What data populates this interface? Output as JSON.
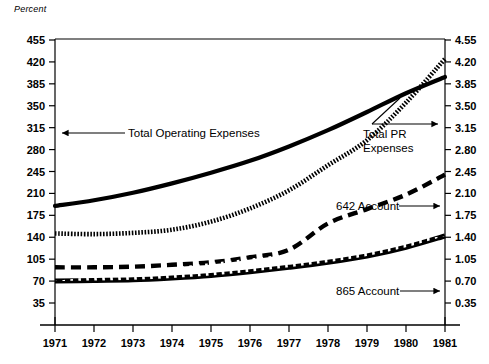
{
  "figure": {
    "unit_label": "Percent"
  },
  "chart_data": {
    "type": "line",
    "title": "",
    "subtitle": "",
    "xlabel": "",
    "ylabel": "Percent",
    "grid": false,
    "legend_position": "inline-annotations",
    "x": [
      1971,
      1972,
      1973,
      1974,
      1975,
      1976,
      1977,
      1978,
      1979,
      1980,
      1981
    ],
    "xtick_labels": [
      "1971",
      "1972",
      "1973",
      "1974",
      "1975",
      "1976",
      "1977",
      "1978",
      "1979",
      "1980",
      "1981"
    ],
    "xlim": [
      1971,
      1981
    ],
    "left_axis": {
      "label": "Percent",
      "ylim": [
        0,
        455
      ],
      "ticks": [
        35,
        70,
        105,
        140,
        175,
        210,
        245,
        280,
        315,
        350,
        385,
        420,
        455
      ],
      "tick_labels": [
        "35",
        "70",
        "105",
        "140",
        "175",
        "210",
        "245",
        "280",
        "315",
        "350",
        "385",
        "420",
        "455"
      ]
    },
    "right_axis": {
      "label": "",
      "ylim": [
        0,
        4.55
      ],
      "ticks": [
        0.35,
        0.7,
        1.05,
        1.4,
        1.75,
        2.1,
        2.45,
        2.8,
        3.15,
        3.5,
        3.85,
        4.2,
        4.55
      ],
      "tick_labels": [
        "0.35",
        "0.70",
        "1.05",
        "1.40",
        "1.75",
        "2.10",
        "2.45",
        "2.80",
        "3.15",
        "3.50",
        "3.85",
        "4.20",
        "4.55"
      ]
    },
    "series": [
      {
        "name": "Total Operating Expenses",
        "axis": "left",
        "style": "solid",
        "values": [
          190,
          199,
          211,
          226,
          243,
          262,
          285,
          311,
          340,
          370,
          396
        ]
      },
      {
        "name": "Total PR Expenses",
        "axis": "left",
        "style": "dotted",
        "values": [
          146,
          145,
          147,
          152,
          165,
          186,
          215,
          255,
          295,
          355,
          425
        ]
      },
      {
        "name": "642 Account",
        "axis": "left",
        "style": "dashed",
        "values": [
          92,
          92,
          93,
          96,
          100,
          108,
          120,
          162,
          185,
          208,
          240
        ]
      },
      {
        "name": "865 Account",
        "axis": "left",
        "style": "hatched",
        "values": [
          70,
          71,
          72,
          75,
          79,
          85,
          92,
          100,
          110,
          124,
          142
        ]
      }
    ],
    "annotations": [
      {
        "text": "Total Operating Expenses",
        "arrow_direction": "left",
        "target_series": "Total Operating Expenses"
      },
      {
        "text": "Total PR Expenses",
        "text_line_1": "Total PR",
        "text_line_2": "Expenses",
        "arrow_direction": "up-right",
        "target_series": "Total PR Expenses"
      },
      {
        "text": "642 Account",
        "arrow_direction": "right",
        "target_series": "642 Account"
      },
      {
        "text": "865 Account",
        "arrow_direction": "right",
        "target_series": "865 Account"
      }
    ]
  }
}
